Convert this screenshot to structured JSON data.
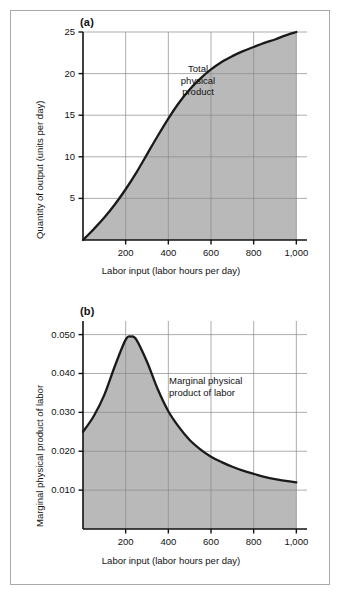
{
  "figure": {
    "background_color": "#ffffff",
    "frame_color": "#a9a9a9",
    "shade_color": "#b9b9b9",
    "curve_color": "#1a1a1a",
    "grid_color": "#8a8a8a",
    "axis_color": "#111111"
  },
  "panel_a": {
    "tag": "(a)",
    "annotation": "Total\nphysical\nproduct",
    "x_axis_title": "Labor input (labor hours per day)",
    "y_axis_title": "Quantity of output (units per day)",
    "x_tick_labels": [
      "200",
      "400",
      "600",
      "800",
      "1,000"
    ],
    "y_tick_labels": [
      "5",
      "10",
      "15",
      "20",
      "25"
    ]
  },
  "panel_b": {
    "tag": "(b)",
    "annotation": "Marginal physical\nproduct of labor",
    "x_axis_title": "Labor input (labor hours per day)",
    "y_axis_title": "Marginal physical product of labor",
    "x_tick_labels": [
      "200",
      "400",
      "600",
      "800",
      "1,000"
    ],
    "y_tick_labels": [
      "0.010",
      "0.020",
      "0.030",
      "0.040",
      "0.050"
    ]
  },
  "chart_data": [
    {
      "type": "line",
      "title": "Total physical product",
      "panel": "(a)",
      "xlabel": "Labor input (labor hours per day)",
      "ylabel": "Quantity of output (units per day)",
      "xlim": [
        0,
        1050
      ],
      "ylim": [
        0,
        25
      ],
      "xticks": [
        200,
        400,
        600,
        800,
        1000
      ],
      "yticks": [
        5,
        10,
        15,
        20,
        25
      ],
      "grid": true,
      "legend": "none",
      "annotations": [
        "Total physical product"
      ],
      "fill_under_curve": true,
      "series": [
        {
          "name": "Total physical product",
          "x": [
            0,
            50,
            100,
            150,
            200,
            250,
            300,
            350,
            400,
            450,
            500,
            550,
            600,
            650,
            700,
            750,
            800,
            850,
            900,
            950,
            1000
          ],
          "y": [
            0.0,
            1.3,
            2.7,
            4.3,
            6.1,
            8.1,
            10.3,
            12.5,
            14.6,
            16.5,
            18.1,
            19.4,
            20.5,
            21.4,
            22.1,
            22.7,
            23.2,
            23.7,
            24.1,
            24.6,
            25.0
          ]
        }
      ]
    },
    {
      "type": "line",
      "title": "Marginal physical product of labor",
      "panel": "(b)",
      "xlabel": "Labor input (labor hours per day)",
      "ylabel": "Marginal physical product of labor",
      "xlim": [
        0,
        1050
      ],
      "ylim": [
        0,
        0.0535
      ],
      "xticks": [
        200,
        400,
        600,
        800,
        1000
      ],
      "yticks": [
        0.01,
        0.02,
        0.03,
        0.04,
        0.05
      ],
      "grid": true,
      "legend": "none",
      "annotations": [
        "Marginal physical product of labor"
      ],
      "fill_under_curve": true,
      "series": [
        {
          "name": "Marginal physical product of labor",
          "x": [
            0,
            50,
            100,
            150,
            200,
            225,
            250,
            300,
            350,
            400,
            450,
            500,
            550,
            600,
            650,
            700,
            750,
            800,
            850,
            900,
            950,
            1000
          ],
          "y": [
            0.025,
            0.029,
            0.0345,
            0.042,
            0.0487,
            0.0495,
            0.0487,
            0.043,
            0.036,
            0.0303,
            0.0262,
            0.0229,
            0.0205,
            0.0186,
            0.0172,
            0.016,
            0.015,
            0.0142,
            0.0134,
            0.0128,
            0.0124,
            0.012
          ]
        }
      ]
    }
  ]
}
